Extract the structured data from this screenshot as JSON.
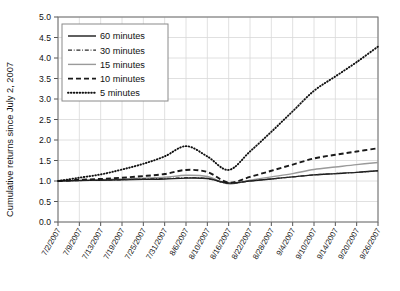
{
  "chart_data": {
    "type": "line",
    "title": "",
    "xlabel": "",
    "ylabel": "Cumulative returns since July 2, 2007",
    "ylim": [
      0.0,
      5.0
    ],
    "ytick_labels": [
      "0.0",
      "0.5",
      "1.0",
      "1.5",
      "2.0",
      "2.5",
      "3.0",
      "3.5",
      "4.0",
      "4.5",
      "5.0"
    ],
    "ytick_values": [
      0.0,
      0.5,
      1.0,
      1.5,
      2.0,
      2.5,
      3.0,
      3.5,
      4.0,
      4.5,
      5.0
    ],
    "grid": true,
    "legend_position": "upper-left",
    "categories": [
      "7/2/2007",
      "7/9/2007",
      "7/13/2007",
      "7/19/2007",
      "7/25/2007",
      "7/31/2007",
      "8/6/2007",
      "8/10/2007",
      "8/16/2007",
      "8/22/2007",
      "8/28/2007",
      "9/4/2007",
      "9/10/2007",
      "9/14/2007",
      "9/20/2007",
      "9/26/2007"
    ],
    "series": [
      {
        "name": "60 minutes",
        "style": "solid",
        "color": "#1a1a1a",
        "values": [
          1.0,
          1.01,
          1.02,
          1.03,
          1.04,
          1.05,
          1.07,
          1.06,
          0.95,
          1.0,
          1.05,
          1.1,
          1.15,
          1.18,
          1.21,
          1.25
        ]
      },
      {
        "name": "30 minutes",
        "style": "dashdot",
        "color": "#2b2b2b",
        "values": [
          1.0,
          1.01,
          1.02,
          1.03,
          1.05,
          1.06,
          1.08,
          1.06,
          0.94,
          1.0,
          1.05,
          1.1,
          1.15,
          1.18,
          1.21,
          1.25
        ]
      },
      {
        "name": "15 minutes",
        "style": "solid",
        "color": "#9a9a9a",
        "values": [
          1.0,
          1.02,
          1.03,
          1.05,
          1.07,
          1.09,
          1.14,
          1.11,
          0.93,
          1.02,
          1.1,
          1.18,
          1.28,
          1.34,
          1.4,
          1.45
        ]
      },
      {
        "name": "10 minutes",
        "style": "dashed",
        "color": "#1a1a1a",
        "values": [
          1.0,
          1.03,
          1.05,
          1.08,
          1.12,
          1.17,
          1.27,
          1.22,
          0.96,
          1.1,
          1.25,
          1.4,
          1.55,
          1.64,
          1.72,
          1.8
        ]
      },
      {
        "name": "5 minutes",
        "style": "dotted",
        "color": "#111111",
        "values": [
          1.0,
          1.08,
          1.16,
          1.28,
          1.42,
          1.6,
          1.85,
          1.6,
          1.27,
          1.72,
          2.2,
          2.7,
          3.2,
          3.55,
          3.9,
          4.28
        ]
      }
    ]
  },
  "legend": {
    "items": [
      {
        "label": "60 minutes"
      },
      {
        "label": "30 minutes"
      },
      {
        "label": "15 minutes"
      },
      {
        "label": "10 minutes"
      },
      {
        "label": "5 minutes"
      }
    ]
  },
  "colors": {
    "axis": "#555555",
    "grid": "#d8d8d8",
    "text": "#111111",
    "background": "#ffffff"
  }
}
